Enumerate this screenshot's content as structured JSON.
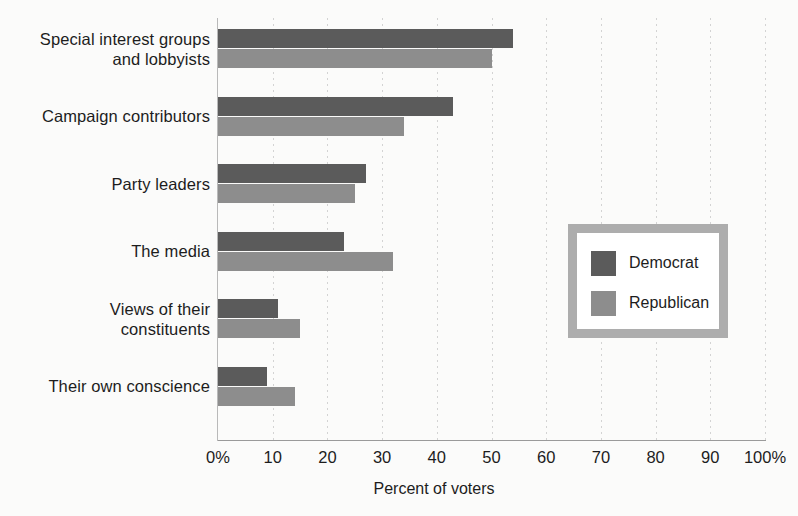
{
  "chart_data": {
    "type": "bar",
    "orientation": "horizontal",
    "title": "",
    "xlabel": "Percent of voters",
    "ylabel": "",
    "xlim": [
      0,
      100
    ],
    "xticks": [
      0,
      10,
      20,
      30,
      40,
      50,
      60,
      70,
      80,
      90,
      100
    ],
    "xtick_labels": [
      "0%",
      "10",
      "20",
      "30",
      "40",
      "50",
      "60",
      "70",
      "80",
      "90",
      "100%"
    ],
    "grid": "vertical-dotted",
    "legend_position": "center-right",
    "categories": [
      "Special interest groups\nand lobbyists",
      "Campaign contributors",
      "Party leaders",
      "The media",
      "Views of their\nconstituents",
      "Their own conscience"
    ],
    "series": [
      {
        "name": "Democrat",
        "color": "#5b5b5b",
        "values": [
          54,
          43,
          27,
          23,
          11,
          9
        ]
      },
      {
        "name": "Republican",
        "color": "#8d8d8d",
        "values": [
          50,
          34,
          25,
          32,
          15,
          14
        ]
      }
    ]
  },
  "legend": {
    "items": [
      {
        "label": "Democrat",
        "swatch": "dem"
      },
      {
        "label": "Republican",
        "swatch": "rep"
      }
    ],
    "border_color": "#adadad",
    "background": "#ffffff"
  },
  "axis": {
    "x_title": "Percent of voters"
  }
}
